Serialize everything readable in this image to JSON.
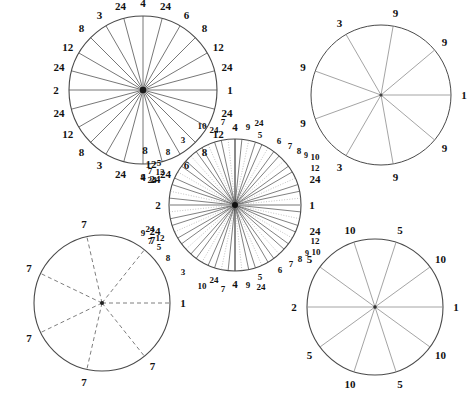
{
  "figure": {
    "title": "",
    "background_color": "#ffffff",
    "stroke_color": "#4a4a4a",
    "label_color": "#111111",
    "width": 462,
    "height": 398
  },
  "chart_data": {
    "type": "diagram",
    "circles": [
      {
        "id": "circle-24",
        "name": "top-left-circle",
        "sectors": 24,
        "center": [
          143,
          90
        ],
        "radius": 74,
        "line_style": "solid",
        "labels": [
          "1",
          "24",
          "12",
          "8",
          "6",
          "24",
          "4",
          "24",
          "3",
          "8",
          "12",
          "24",
          "2",
          "24",
          "12",
          "8",
          "3",
          "24",
          "4",
          "24",
          "6",
          "8",
          "12",
          "24"
        ],
        "label_angles_deg": [
          0,
          15,
          30,
          45,
          60,
          75,
          90,
          105,
          120,
          135,
          150,
          165,
          180,
          195,
          210,
          225,
          240,
          255,
          270,
          285,
          300,
          315,
          330,
          345
        ]
      },
      {
        "id": "circle-9",
        "name": "top-right-circle",
        "sectors": 9,
        "center": [
          381,
          95
        ],
        "radius": 70,
        "line_style": "solid",
        "labels": [
          "1",
          "9",
          "9",
          "3",
          "9",
          "9",
          "3",
          "9",
          "9"
        ],
        "label_angles_deg": [
          0,
          40,
          80,
          120,
          160,
          200,
          240,
          280,
          320
        ]
      },
      {
        "id": "circle-60",
        "name": "middle-circle",
        "sectors": 60,
        "center": [
          235,
          205
        ],
        "radius": 66,
        "line_style": "mixed-solid-dotted",
        "labels": [
          "1",
          "24",
          "12",
          "10",
          "9",
          "8",
          "7",
          "6",
          "24",
          "5",
          "9",
          "4",
          "7",
          "24",
          "10",
          "3",
          "8",
          "5",
          "12",
          "7",
          "9",
          "24",
          "2",
          "24",
          "9",
          "7",
          "12",
          "5",
          "8",
          "3",
          "10",
          "24",
          "7",
          "4",
          "9",
          "5",
          "24",
          "6",
          "7",
          "8",
          "9",
          "10",
          "12",
          "24"
        ],
        "outer_label_rings": {
          "top": [
            "3",
            "10",
            "24",
            "7",
            "4",
            "9",
            "24",
            "5",
            "6",
            "7",
            "8",
            "9",
            "10"
          ],
          "right": [
            "12",
            "24",
            "1",
            "24",
            "12"
          ],
          "bottom": [
            "10",
            "9",
            "8",
            "7",
            "6",
            "24",
            "5",
            "9",
            "4",
            "7",
            "24",
            "10",
            "3"
          ],
          "left": [
            "8",
            "5",
            "12",
            "7",
            "9",
            "24",
            "2",
            "24",
            "9",
            "7",
            "12",
            "5",
            "8"
          ]
        }
      },
      {
        "id": "circle-7",
        "name": "bottom-left-circle",
        "sectors": 7,
        "center": [
          102,
          303
        ],
        "radius": 68,
        "line_style": "dashed",
        "labels": [
          "1",
          "7",
          "7",
          "7",
          "7",
          "7",
          "7"
        ],
        "label_angles_deg": [
          0,
          51.43,
          102.86,
          154.29,
          205.71,
          257.14,
          308.57
        ]
      },
      {
        "id": "circle-10",
        "name": "bottom-right-circle",
        "sectors": 10,
        "center": [
          375,
          307
        ],
        "radius": 68,
        "line_style": "solid",
        "labels": [
          "1",
          "10",
          "5",
          "10",
          "5",
          "2",
          "5",
          "10",
          "5",
          "10"
        ],
        "label_angles_deg": [
          0,
          36,
          72,
          108,
          144,
          180,
          216,
          252,
          288,
          324
        ]
      }
    ]
  }
}
